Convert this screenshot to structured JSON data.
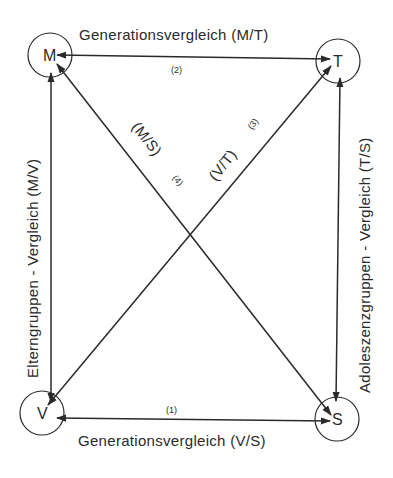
{
  "diagram": {
    "nodes": [
      {
        "id": "M",
        "label": "M",
        "cx": 50,
        "cy": 55
      },
      {
        "id": "T",
        "label": "T",
        "cx": 338,
        "cy": 61
      },
      {
        "id": "V",
        "label": "V",
        "cx": 42,
        "cy": 413
      },
      {
        "id": "S",
        "label": "S",
        "cx": 337,
        "cy": 419
      }
    ],
    "edges": {
      "top": {
        "label": "Generationsvergleich (M/T)",
        "number": "(2)"
      },
      "bottom": {
        "label": "Generationsvergleich (V/S)",
        "number": "(1)"
      },
      "left": {
        "label": "Elterngruppen - Vergleich (M/V)"
      },
      "right": {
        "label": "Adoleszenzgruppen - Vergleich (T/S)"
      },
      "diag_ms": {
        "label": "(M/S)",
        "number": "(4)"
      },
      "diag_vt": {
        "label": "(V/T)",
        "number": "(3)"
      }
    }
  }
}
